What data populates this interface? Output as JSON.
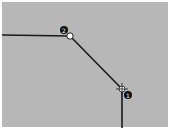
{
  "canvas": {
    "background": "#b7b7b7",
    "line_color": "#1a1a1a"
  },
  "path": {
    "points": [
      [
        2,
        35
      ],
      [
        70,
        36
      ],
      [
        122,
        89
      ],
      [
        122,
        128
      ]
    ]
  },
  "markers": [
    {
      "id": "point-2",
      "label": "2",
      "x": 70,
      "y": 36,
      "type": "hollow-circle",
      "badge_x": 64,
      "badge_y": 30
    },
    {
      "id": "point-1",
      "label": "1",
      "x": 122,
      "y": 89,
      "type": "crosshair",
      "badge_x": 128,
      "badge_y": 95
    }
  ]
}
